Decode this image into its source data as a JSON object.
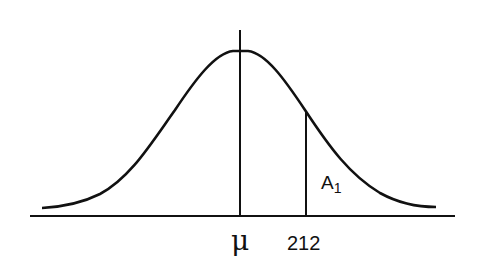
{
  "diagram": {
    "type": "normal-distribution-curve",
    "labels": {
      "mean_symbol": "μ",
      "x_value": "212",
      "area_label_main": "A",
      "area_label_sub": "1"
    },
    "colors": {
      "stroke": "#111111",
      "background": "#ffffff"
    }
  }
}
